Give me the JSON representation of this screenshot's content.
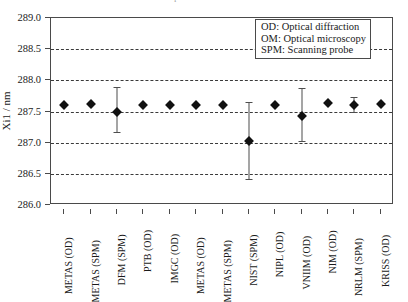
{
  "figure": {
    "title_cutoff": "Comparison of Xi1 results",
    "ylabel": "Xi1 / nm"
  },
  "legend": {
    "items": [
      "OD: Optical diffraction",
      "OM: Optical microscopy",
      "SPM: Scanning probe"
    ]
  },
  "chart_data": {
    "type": "scatter",
    "title": "",
    "xlabel": "",
    "ylabel": "Xi1 / nm",
    "ylim": [
      286.0,
      289.0
    ],
    "yticks": [
      286.0,
      286.5,
      287.0,
      287.5,
      288.0,
      288.5,
      289.0
    ],
    "ytick_labels": [
      "286.0",
      "286.5",
      "287.0",
      "287.5",
      "288.0",
      "288.5",
      "289.0"
    ],
    "grid": true,
    "legend_position": "top-right",
    "categories": [
      "METAS (OD)",
      "METAS (SPM)",
      "DFM (SPM)",
      "PTB (OD)",
      "IMGC (OD)",
      "METAS (OD)",
      "METAS (SPM)",
      "NIST (SPM)",
      "NIPL (OD)",
      "VNIIM (OD)",
      "NIM (OD)",
      "NRLM (SPM)",
      "KRISS (OD)"
    ],
    "values": [
      287.6,
      287.62,
      287.5,
      287.6,
      287.61,
      287.61,
      287.6,
      287.03,
      287.61,
      287.42,
      287.63,
      287.61,
      287.62
    ],
    "err_low": [
      287.6,
      287.62,
      287.17,
      287.6,
      287.61,
      287.61,
      287.6,
      286.42,
      287.61,
      287.02,
      287.63,
      287.49,
      287.62
    ],
    "err_high": [
      287.6,
      287.62,
      287.9,
      287.6,
      287.61,
      287.61,
      287.6,
      287.66,
      287.61,
      287.87,
      287.63,
      287.73,
      287.62
    ],
    "marker": "diamond",
    "marker_color": "#111111",
    "errorbar_color": "#4d4d4d"
  }
}
